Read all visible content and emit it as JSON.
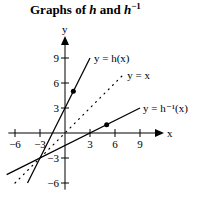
{
  "chart_data": {
    "type": "line",
    "title_main": "Graphs of ",
    "title_h": "h",
    "title_and": " and ",
    "title_hinv": "h",
    "title_sup": "−1",
    "xlabel": "x",
    "ylabel": "y",
    "xlim": [
      -6,
      9
    ],
    "ylim": [
      -6,
      9
    ],
    "xticks": [
      -6,
      -3,
      3,
      6,
      9
    ],
    "yticks": [
      9,
      6,
      3,
      -3,
      -6
    ],
    "xtick_labels": [
      "−6",
      "−3",
      "3",
      "6",
      "9"
    ],
    "ytick_labels": [
      "9",
      "6",
      "3",
      "−3",
      "−6"
    ],
    "grid": false,
    "series": [
      {
        "name": "h",
        "label": "y = h(x)",
        "style": "solid",
        "points": [
          [
            -4.5,
            -6
          ],
          [
            3,
            9
          ]
        ]
      },
      {
        "name": "identity",
        "label": "y = x",
        "style": "dotted",
        "points": [
          [
            -6,
            -6
          ],
          [
            7,
            7
          ]
        ]
      },
      {
        "name": "h_inverse",
        "label": "y = h⁻¹(x)",
        "style": "solid",
        "points": [
          [
            -7,
            -5
          ],
          [
            9,
            3
          ]
        ]
      }
    ],
    "marked_points": [
      {
        "series": "h",
        "x": 1,
        "y": 5
      },
      {
        "series": "h_inverse",
        "x": 5,
        "y": 1
      }
    ]
  }
}
